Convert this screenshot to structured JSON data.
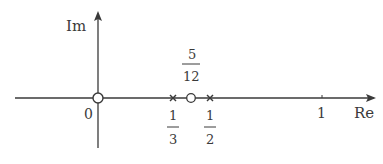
{
  "diagram": {
    "axes": {
      "real_label": "Re",
      "imag_label": "Im",
      "origin_label": "0",
      "tick_label_one": "1"
    },
    "zeros": [
      {
        "value": 0,
        "label": "0"
      },
      {
        "value": 0.4167,
        "label_num": "5",
        "label_den": "12"
      }
    ],
    "poles": [
      {
        "value": 0.3333,
        "label_num": "1",
        "label_den": "3"
      },
      {
        "value": 0.5,
        "label_num": "1",
        "label_den": "2"
      }
    ],
    "colors": {
      "stroke": "#3a3a3a",
      "background": "#ffffff"
    }
  }
}
